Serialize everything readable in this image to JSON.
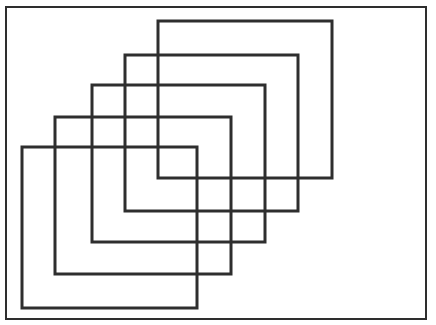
{
  "diagram": {
    "title": "",
    "background": "#ffffff",
    "stroke_color": "#2e2e2e",
    "frame": {
      "x1": 6,
      "y1": 7,
      "x2": 426,
      "y2": 319,
      "stroke_width": 2
    },
    "rectangles": [
      {
        "id": "rect-1",
        "x1": 22,
        "y1": 147,
        "x2": 197,
        "y2": 308,
        "stroke_width": 3
      },
      {
        "id": "rect-2",
        "x1": 55,
        "y1": 117,
        "x2": 231,
        "y2": 274,
        "stroke_width": 3
      },
      {
        "id": "rect-3",
        "x1": 92,
        "y1": 85,
        "x2": 265,
        "y2": 242,
        "stroke_width": 3
      },
      {
        "id": "rect-4",
        "x1": 125,
        "y1": 55,
        "x2": 298,
        "y2": 211,
        "stroke_width": 3
      },
      {
        "id": "rect-5",
        "x1": 158,
        "y1": 21,
        "x2": 332,
        "y2": 178,
        "stroke_width": 3
      }
    ]
  }
}
